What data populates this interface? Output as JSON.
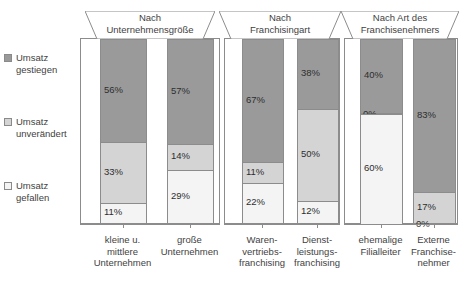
{
  "legend": {
    "items": [
      {
        "label": "Umsatz\ngestiegen",
        "color": "#9a9a9a",
        "key": "gestiegen"
      },
      {
        "label": "Umsatz\nunverändert",
        "color": "#d4d4d4",
        "key": "unveraendert"
      },
      {
        "label": "Umsatz\ngefallen",
        "color": "#f4f4f4",
        "key": "gefallen"
      }
    ]
  },
  "panels": [
    {
      "title": "Nach\nUnternehmensgröße",
      "bars": [
        {
          "category": "kleine u.\nmittlere\nUnternehmen",
          "segments": [
            {
              "label": "56%",
              "value": 56
            },
            {
              "label": "33%",
              "value": 33
            },
            {
              "label": "11%",
              "value": 11
            }
          ]
        },
        {
          "category": "große\nUnternehmen",
          "segments": [
            {
              "label": "57%",
              "value": 57
            },
            {
              "label": "14%",
              "value": 14
            },
            {
              "label": "29%",
              "value": 29
            }
          ]
        }
      ]
    },
    {
      "title": "Nach\nFranchisingart",
      "bars": [
        {
          "category": "Waren-\nvertriebs-\nfranchising",
          "segments": [
            {
              "label": "67%",
              "value": 67
            },
            {
              "label": "11%",
              "value": 11
            },
            {
              "label": "22%",
              "value": 22
            }
          ]
        },
        {
          "category": "Dienst-\nleistungs-\nfranchising",
          "segments": [
            {
              "label": "38%",
              "value": 38
            },
            {
              "label": "50%",
              "value": 50
            },
            {
              "label": "12%",
              "value": 12
            }
          ]
        }
      ]
    },
    {
      "title": "Nach Art des\nFranchisenehmers",
      "bars": [
        {
          "category": "ehemalige\nFilialleiter",
          "segments": [
            {
              "label": "40%",
              "value": 40
            },
            {
              "label": "0%",
              "value": 0
            },
            {
              "label": "60%",
              "value": 60
            }
          ]
        },
        {
          "category": "Externe\nFranchise-\nnehmer",
          "segments": [
            {
              "label": "83%",
              "value": 83
            },
            {
              "label": "17%",
              "value": 17
            },
            {
              "label": "0%",
              "value": 0
            }
          ]
        }
      ]
    }
  ],
  "chart_data": {
    "type": "bar",
    "subtype": "stacked-100-percent",
    "title": "",
    "xlabel": "",
    "ylabel": "",
    "ylim": [
      0,
      100
    ],
    "grid": false,
    "legend_position": "left",
    "series": [
      {
        "name": "Umsatz gestiegen",
        "color": "#9a9a9a",
        "values": [
          56,
          57,
          67,
          38,
          40,
          83
        ]
      },
      {
        "name": "Umsatz unverändert",
        "color": "#d4d4d4",
        "values": [
          33,
          14,
          11,
          50,
          0,
          17
        ]
      },
      {
        "name": "Umsatz gefallen",
        "color": "#f4f4f4",
        "values": [
          11,
          29,
          22,
          12,
          60,
          0
        ]
      }
    ],
    "categories": [
      "kleine u. mittlere Unternehmen",
      "große Unternehmen",
      "Warenvertriebsfranchising",
      "Dienstleistungsfranchising",
      "ehemalige Filialleiter",
      "Externe Franchisenehmer"
    ],
    "groups": [
      {
        "label": "Nach Unternehmensgröße",
        "categories": [
          0,
          1
        ]
      },
      {
        "label": "Nach Franchisingart",
        "categories": [
          2,
          3
        ]
      },
      {
        "label": "Nach Art des Franchisenehmers",
        "categories": [
          4,
          5
        ]
      }
    ]
  },
  "layout": {
    "panel_geometry": [
      {
        "left": 80,
        "width": 140,
        "banner_left": 85,
        "banner_width": 130
      },
      {
        "left": 224,
        "width": 116,
        "banner_left": 219,
        "banner_width": 122
      },
      {
        "left": 344,
        "width": 114,
        "banner_left": 341,
        "banner_width": 118
      }
    ],
    "bar_offsets": [
      [
        {
          "left": 19,
          "width": 47
        },
        {
          "left": 86,
          "width": 47
        }
      ],
      [
        {
          "left": 17,
          "width": 42
        },
        {
          "left": 72,
          "width": 42
        }
      ],
      [
        {
          "left": 15,
          "width": 43
        },
        {
          "left": 68,
          "width": 43
        }
      ]
    ],
    "colors": {
      "border": "#8c8c8c",
      "text": "#3f3f3f",
      "label_text": "#2e2e2e"
    }
  }
}
